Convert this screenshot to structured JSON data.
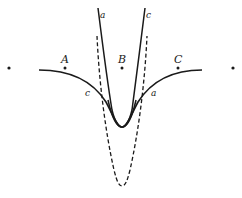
{
  "diagram": {
    "points": [
      {
        "id": "left-outer",
        "label": "",
        "x": 9,
        "y": 68
      },
      {
        "id": "A",
        "label": "A",
        "x": 65,
        "y": 68
      },
      {
        "id": "B",
        "label": "B",
        "x": 122,
        "y": 68
      },
      {
        "id": "C",
        "label": "C",
        "x": 178,
        "y": 68
      },
      {
        "id": "right-outer",
        "label": "",
        "x": 233,
        "y": 68
      }
    ],
    "curve_labels": {
      "narrow_left_top": "a",
      "narrow_right_top": "c",
      "wide_left": "c",
      "wide_right": "a"
    },
    "colors": {
      "stroke": "#1a1a1a",
      "background": "#ffffff"
    }
  }
}
